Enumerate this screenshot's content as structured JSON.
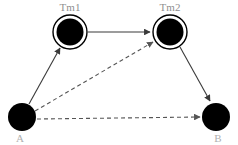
{
  "diagram": {
    "type": "directed-graph",
    "width": 238,
    "height": 145,
    "background_color": "#ffffff",
    "nodes": [
      {
        "id": "Tm1",
        "label": "Tm1",
        "shape": "double-circle",
        "fill_color": "#000000",
        "stroke_color": "#000000",
        "label_color": "#8f8f8f",
        "label_position": "above",
        "cx": 70,
        "cy": 32,
        "r_outer": 17,
        "r_inner": 13
      },
      {
        "id": "Tm2",
        "label": "Tm2",
        "shape": "double-circle",
        "fill_color": "#000000",
        "stroke_color": "#000000",
        "label_color": "#8f8f8f",
        "label_position": "above",
        "cx": 170,
        "cy": 32,
        "r_outer": 17,
        "r_inner": 13
      },
      {
        "id": "A",
        "label": "A",
        "shape": "circle",
        "fill_color": "#000000",
        "stroke_color": "#000000",
        "label_color": "#b0b0b0",
        "label_position": "below",
        "cx": 22,
        "cy": 117,
        "r_outer": 14,
        "r_inner": 14
      },
      {
        "id": "B",
        "label": "B",
        "shape": "circle",
        "fill_color": "#000000",
        "stroke_color": "#000000",
        "label_color": "#b0b0b0",
        "label_position": "below",
        "cx": 216,
        "cy": 117,
        "r_outer": 14,
        "r_inner": 14
      }
    ],
    "edges": [
      {
        "id": "tm1-to-tm2",
        "from": "Tm1",
        "to": "Tm2",
        "style": "solid",
        "arrow": true,
        "color": "#3a3a3a"
      },
      {
        "id": "a-to-tm1",
        "from": "A",
        "to": "Tm1",
        "style": "solid",
        "arrow": true,
        "color": "#3a3a3a"
      },
      {
        "id": "tm2-to-b",
        "from": "Tm2",
        "to": "B",
        "style": "solid",
        "arrow": true,
        "color": "#3a3a3a"
      },
      {
        "id": "a-to-tm2",
        "from": "A",
        "to": "Tm2",
        "style": "dashed",
        "arrow": true,
        "color": "#555555"
      },
      {
        "id": "a-to-b",
        "from": "A",
        "to": "B",
        "style": "dashed",
        "arrow": true,
        "color": "#555555"
      }
    ]
  }
}
